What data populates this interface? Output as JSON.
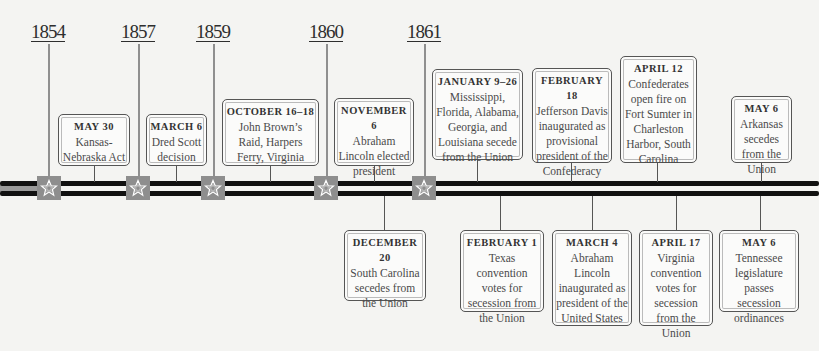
{
  "years": [
    {
      "label": "1854",
      "x": 48
    },
    {
      "label": "1857",
      "x": 138
    },
    {
      "label": "1859",
      "x": 213
    },
    {
      "label": "1860",
      "x": 326
    },
    {
      "label": "1861",
      "x": 424
    }
  ],
  "events_above": [
    {
      "date": "MAY 30",
      "text": "Kansas-Nebraska Act"
    },
    {
      "date": "MARCH 6",
      "text": "Dred Scott decision"
    },
    {
      "date": "OCTOBER 16–18",
      "text": "John Brown’s Raid, Harpers Ferry, Virginia"
    },
    {
      "date": "NOVEMBER 6",
      "text": "Abraham Lincoln elected president"
    },
    {
      "date": "JANUARY 9–26",
      "text": "Mississippi, Florida, Alabama, Georgia, and Louisiana secede from the Union"
    },
    {
      "date": "FEBRUARY 18",
      "text": "Jefferson Davis inaugurated as provisional president of the Confederacy"
    },
    {
      "date": "APRIL 12",
      "text": "Confederates open fire on Fort Sumter in Charleston Harbor, South Carolina"
    },
    {
      "date": "MAY 6",
      "text": "Arkansas secedes from the Union"
    }
  ],
  "events_below": [
    {
      "date": "DECEMBER 20",
      "text": "South Carolina secedes from the Union"
    },
    {
      "date": "FEBRUARY 1",
      "text": "Texas convention votes for secession from the Union"
    },
    {
      "date": "MARCH 4",
      "text": "Abraham Lincoln inaugurated as president of the United States"
    },
    {
      "date": "APRIL 17",
      "text": "Virginia convention votes for secession from the Union"
    },
    {
      "date": "MAY 6",
      "text": "Tennessee legislature passes secession ordinances"
    }
  ],
  "colors": {
    "marker": "#8e8e8e",
    "rope": "#111111",
    "background": "#f4f4f2"
  }
}
